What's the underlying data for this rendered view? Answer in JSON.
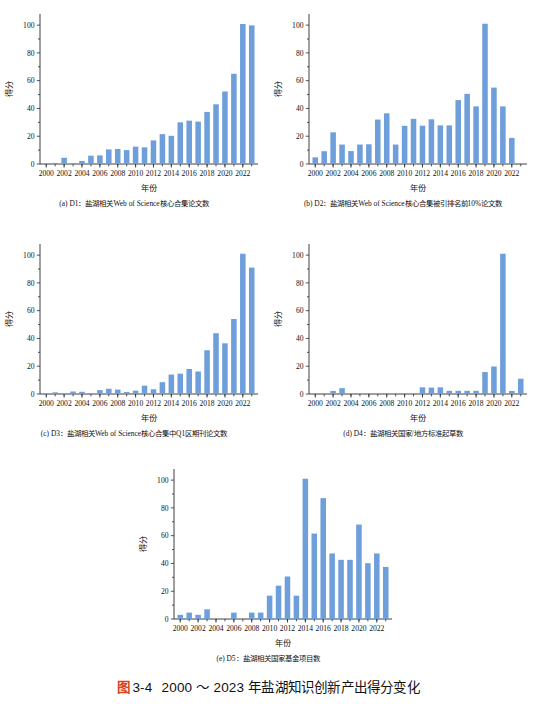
{
  "figure": {
    "tag": "图",
    "number": "3-4",
    "title": "2000 ～ 2023 年盐湖知识创新产出得分变化",
    "accent_color": "#d9441f",
    "bar_color": "#6e9fdb",
    "axis_color": "#2b2b2b",
    "background": "#ffffff"
  },
  "common": {
    "xlabel": "年份",
    "ylabel": "得分",
    "ytick_labels": [
      "0",
      "20",
      "40",
      "60",
      "80",
      "100"
    ],
    "ytick_values": [
      0,
      20,
      40,
      60,
      80,
      100
    ],
    "xtick_labels": [
      "2000",
      "2002",
      "2004",
      "2006",
      "2008",
      "2010",
      "2012",
      "2014",
      "2016",
      "2018",
      "2020",
      "2022"
    ],
    "xtick_values": [
      2000,
      2002,
      2004,
      2006,
      2008,
      2010,
      2012,
      2014,
      2016,
      2018,
      2020,
      2022
    ]
  },
  "chart_data": [
    {
      "id": "D1",
      "panel": "a",
      "caption": "(a) D1：盐湖相关Web of Science核心合集论文数",
      "type": "bar",
      "title": "",
      "xlabel": "年份",
      "ylabel": "得分",
      "ylim": [
        0,
        108
      ],
      "xlim": [
        1999.3,
        2023.7
      ],
      "grid": false,
      "legend": "none",
      "categories": [
        2000,
        2001,
        2002,
        2003,
        2004,
        2005,
        2006,
        2007,
        2008,
        2009,
        2010,
        2011,
        2012,
        2013,
        2014,
        2015,
        2016,
        2017,
        2018,
        2019,
        2020,
        2021,
        2022,
        2023
      ],
      "values": [
        0.3,
        0.8,
        4.5,
        0.2,
        2.2,
        6.0,
        6.2,
        10.5,
        10.8,
        10.0,
        12.5,
        12.0,
        17.0,
        21.5,
        20.3,
        30.0,
        31.2,
        30.5,
        37.5,
        43.0,
        52.2,
        65.0,
        100.8,
        99.8
      ]
    },
    {
      "id": "D2",
      "panel": "b",
      "caption": "(b) D2：盐湖相关Web of Science核心合集被引排名前10%论文数",
      "type": "bar",
      "title": "",
      "xlabel": "年份",
      "ylabel": "得分",
      "ylim": [
        0,
        108
      ],
      "xlim": [
        1999.3,
        2023.7
      ],
      "grid": false,
      "legend": "none",
      "categories": [
        2000,
        2001,
        2002,
        2003,
        2004,
        2005,
        2006,
        2007,
        2008,
        2009,
        2010,
        2011,
        2012,
        2013,
        2014,
        2015,
        2016,
        2017,
        2018,
        2019,
        2020,
        2021,
        2022,
        2023
      ],
      "values": [
        4.8,
        9.2,
        22.8,
        14.0,
        9.3,
        14.0,
        14.2,
        32.0,
        36.5,
        14.0,
        27.5,
        32.5,
        27.6,
        32.2,
        27.8,
        27.8,
        46.0,
        50.5,
        41.5,
        101.0,
        55.0,
        41.5,
        18.8,
        0.0
      ]
    },
    {
      "id": "D3",
      "panel": "c",
      "caption": "(c) D3：盐湖相关Web of Science核心合集中Q1区期刊论文数",
      "type": "bar",
      "title": "",
      "xlabel": "年份",
      "ylabel": "得分",
      "ylim": [
        0,
        108
      ],
      "xlim": [
        1999.3,
        2023.7
      ],
      "grid": false,
      "legend": "none",
      "categories": [
        2000,
        2001,
        2002,
        2003,
        2004,
        2005,
        2006,
        2007,
        2008,
        2009,
        2010,
        2011,
        2012,
        2013,
        2014,
        2015,
        2016,
        2017,
        2018,
        2019,
        2020,
        2021,
        2022,
        2023
      ],
      "values": [
        0.2,
        1.2,
        0.2,
        1.8,
        1.6,
        0.3,
        2.8,
        3.8,
        3.2,
        1.5,
        2.4,
        6.0,
        3.4,
        8.5,
        14.0,
        14.6,
        18.0,
        16.2,
        31.5,
        43.8,
        36.5,
        54.0,
        101.0,
        91.0
      ]
    },
    {
      "id": "D4",
      "panel": "d",
      "caption": "(d) D4：盐湖相关国家/地方标准起草数",
      "type": "bar",
      "title": "",
      "xlabel": "年份",
      "ylabel": "得分",
      "ylim": [
        0,
        108
      ],
      "xlim": [
        1999.3,
        2023.7
      ],
      "grid": false,
      "legend": "none",
      "categories": [
        2000,
        2001,
        2002,
        2003,
        2004,
        2005,
        2006,
        2007,
        2008,
        2009,
        2010,
        2011,
        2012,
        2013,
        2014,
        2015,
        2016,
        2017,
        2018,
        2019,
        2020,
        2021,
        2022,
        2023
      ],
      "values": [
        0.0,
        0.0,
        2.2,
        4.2,
        0.0,
        0.0,
        0.0,
        0.0,
        0.0,
        0.0,
        0.0,
        0.0,
        4.8,
        4.6,
        4.8,
        2.3,
        2.3,
        2.3,
        2.3,
        15.8,
        19.8,
        101.0,
        2.2,
        11.0
      ]
    },
    {
      "id": "D5",
      "panel": "e",
      "caption": "(e) D5：盐湖相关国家基金项目数",
      "type": "bar",
      "title": "",
      "xlabel": "年份",
      "ylabel": "得分",
      "ylim": [
        0,
        108
      ],
      "xlim": [
        1999.3,
        2023.7
      ],
      "grid": false,
      "legend": "none",
      "categories": [
        2000,
        2001,
        2002,
        2003,
        2004,
        2005,
        2006,
        2007,
        2008,
        2009,
        2010,
        2011,
        2012,
        2013,
        2014,
        2015,
        2016,
        2017,
        2018,
        2019,
        2020,
        2021,
        2022,
        2023
      ],
      "values": [
        3.0,
        4.6,
        3.0,
        7.0,
        0.0,
        0.0,
        4.6,
        0.0,
        4.6,
        4.6,
        16.8,
        24.0,
        30.6,
        16.8,
        101.0,
        61.5,
        87.0,
        47.2,
        42.6,
        42.6,
        68.0,
        40.2,
        47.2,
        37.5
      ]
    }
  ]
}
